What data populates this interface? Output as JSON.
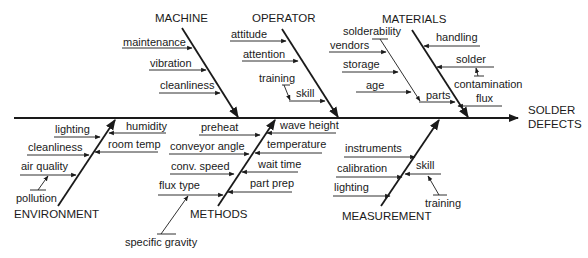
{
  "diagram": {
    "type": "fishbone",
    "effect": {
      "line1": "SOLDER",
      "line2": "DEFECTS"
    },
    "categories": {
      "machine": {
        "label": "MACHINE",
        "causes": [
          "maintenance",
          "vibration",
          "cleanliness"
        ]
      },
      "operator": {
        "label": "OPERATOR",
        "causes": [
          "attitude",
          "attention",
          "skill"
        ],
        "sub_causes": {
          "skill": [
            "training"
          ]
        }
      },
      "materials": {
        "label": "MATERIALS",
        "causes": [
          "handling",
          "solder",
          "flux",
          "parts"
        ],
        "sub_causes": {
          "solder": [
            "contamination"
          ],
          "parts": [
            "solderability",
            "vendors",
            "storage",
            "age"
          ]
        }
      },
      "environment": {
        "label": "ENVIRONMENT",
        "causes": [
          "lighting",
          "cleanliness",
          "air quality",
          "humidity",
          "room temp"
        ],
        "sub_causes": {
          "air quality": [
            "pollution"
          ]
        }
      },
      "methods": {
        "label": "METHODS",
        "causes": [
          "preheat",
          "conveyor angle",
          "conv. speed",
          "flux type",
          "wave height",
          "temperature",
          "wait time",
          "part prep"
        ],
        "sub_causes": {
          "flux type": [
            "specific gravity"
          ]
        }
      },
      "measurement": {
        "label": "MEASUREMENT",
        "causes": [
          "instruments",
          "calibration",
          "lighting",
          "skill"
        ],
        "sub_causes": {
          "skill": [
            "training"
          ]
        }
      }
    }
  }
}
